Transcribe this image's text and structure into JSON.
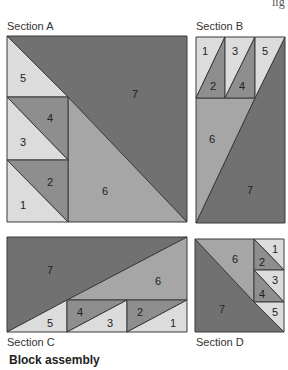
{
  "header_fragment": "lig",
  "colors": {
    "light": "#dcdcdc",
    "medium": "#a6a6a6",
    "mediumdark": "#8e8e8e",
    "dark": "#717171",
    "stroke": "#3a3a3a"
  },
  "sections": {
    "a": {
      "label": "Section A",
      "pieces": [
        "1",
        "2",
        "3",
        "4",
        "5",
        "6",
        "7"
      ]
    },
    "b": {
      "label": "Section B",
      "pieces": [
        "1",
        "2",
        "3",
        "4",
        "5",
        "6",
        "7"
      ]
    },
    "c": {
      "label": "Section C",
      "pieces": [
        "1",
        "2",
        "3",
        "4",
        "5",
        "6",
        "7"
      ]
    },
    "d": {
      "label": "Section D",
      "pieces": [
        "1",
        "2",
        "3",
        "4",
        "5",
        "6",
        "7"
      ]
    }
  },
  "caption": "Block assembly"
}
